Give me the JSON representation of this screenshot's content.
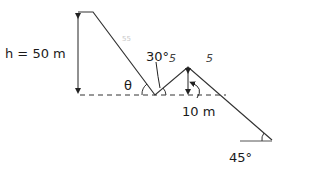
{
  "diagram": {
    "labels": {
      "height": "h = 50 m",
      "theta": "θ",
      "angle_valley": "30°",
      "step_height": "10 m",
      "angle_bottom": "45°",
      "handwritten_1": "55",
      "handwritten_2": "5",
      "handwritten_3": "5"
    },
    "colors": {
      "line": "#333333",
      "text": "#1a1a1a"
    }
  }
}
